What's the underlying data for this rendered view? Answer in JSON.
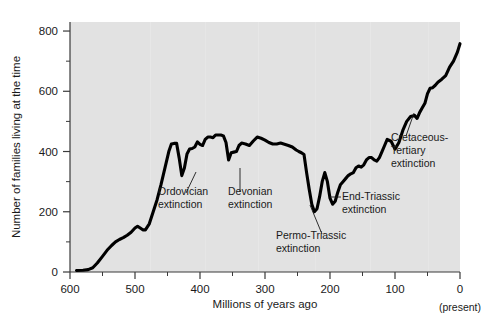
{
  "chart_data": {
    "type": "line",
    "title": "",
    "xlabel": "Millions of years ago",
    "ylabel": "Number of families living at the time",
    "xlim": [
      600,
      0
    ],
    "ylim": [
      0,
      830
    ],
    "x_ticks": [
      600,
      500,
      400,
      300,
      200,
      100,
      0
    ],
    "x_tick_labels": [
      "600",
      "500",
      "400",
      "300",
      "200",
      "100",
      "0"
    ],
    "x_minor_ticks": [
      550,
      450,
      350,
      250,
      150,
      50
    ],
    "y_ticks": [
      0,
      200,
      400,
      600,
      800
    ],
    "y_tick_labels": [
      "0",
      "200",
      "400",
      "600",
      "800"
    ],
    "y_minor_ticks": [
      100,
      300,
      500,
      700
    ],
    "grid": false,
    "legend": "none",
    "x_axis_direction": "reversed",
    "present_note": "(present)",
    "line_color": "#000000",
    "plot_background": "#e2e2e2",
    "series": [
      {
        "name": "Number of families",
        "x": [
          590,
          580,
          572,
          565,
          558,
          550,
          543,
          536,
          530,
          524,
          518,
          512,
          506,
          500,
          496,
          492,
          488,
          484,
          478,
          472,
          466,
          460,
          454,
          448,
          444,
          440,
          436,
          432,
          428,
          424,
          420,
          416,
          412,
          408,
          404,
          400,
          396,
          392,
          388,
          384,
          380,
          376,
          372,
          368,
          364,
          360,
          356,
          352,
          348,
          344,
          340,
          336,
          330,
          324,
          318,
          312,
          306,
          300,
          294,
          288,
          282,
          276,
          270,
          264,
          258,
          252,
          248,
          244,
          240,
          236,
          232,
          228,
          224,
          220,
          216,
          212,
          208,
          204,
          200,
          196,
          192,
          188,
          184,
          180,
          176,
          172,
          168,
          164,
          160,
          156,
          152,
          148,
          144,
          140,
          136,
          132,
          128,
          124,
          120,
          116,
          112,
          106,
          100,
          94,
          88,
          82,
          76,
          70,
          66,
          62,
          58,
          54,
          50,
          46,
          42,
          38,
          34,
          28,
          22,
          16,
          10,
          4,
          0
        ],
        "y": [
          5,
          6,
          8,
          14,
          30,
          52,
          72,
          88,
          100,
          108,
          114,
          122,
          132,
          146,
          152,
          146,
          140,
          140,
          160,
          200,
          240,
          290,
          345,
          400,
          425,
          427,
          427,
          378,
          320,
          345,
          392,
          408,
          410,
          415,
          432,
          424,
          420,
          440,
          448,
          448,
          446,
          455,
          455,
          455,
          452,
          430,
          372,
          396,
          398,
          400,
          420,
          428,
          425,
          420,
          435,
          448,
          444,
          438,
          430,
          425,
          425,
          428,
          424,
          420,
          415,
          405,
          400,
          396,
          390,
          330,
          275,
          225,
          200,
          210,
          250,
          300,
          330,
          300,
          245,
          225,
          235,
          265,
          290,
          300,
          310,
          320,
          326,
          330,
          346,
          352,
          348,
          356,
          372,
          380,
          380,
          372,
          368,
          380,
          400,
          420,
          440,
          434,
          408,
          430,
          470,
          500,
          516,
          520,
          510,
          530,
          545,
          560,
          592,
          610,
          612,
          620,
          630,
          640,
          652,
          680,
          700,
          730,
          758
        ]
      }
    ],
    "annotations": [
      {
        "id": "ordovician",
        "lines": [
          "Ordovician",
          "extinction"
        ],
        "text_x": 158,
        "text_y": 195,
        "leader": {
          "x1": 186,
          "y1": 193,
          "x2": 196,
          "y2": 172
        }
      },
      {
        "id": "devonian",
        "lines": [
          "Devonian",
          "extinction"
        ],
        "text_x": 228,
        "text_y": 195,
        "leader": {
          "x1": 240,
          "y1": 192,
          "x2": 240,
          "y2": 168
        }
      },
      {
        "id": "permo-triassic",
        "lines": [
          "Permo-Triassic",
          "extinction"
        ],
        "text_x": 276,
        "text_y": 239,
        "leader": {
          "x1": 322,
          "y1": 234,
          "x2": 310,
          "y2": 205
        }
      },
      {
        "id": "end-triassic",
        "lines": [
          "End-Triassic",
          "extinction"
        ],
        "text_x": 342,
        "text_y": 200,
        "leader": {
          "x1": 341,
          "y1": 197,
          "x2": 330,
          "y2": 197
        }
      },
      {
        "id": "cretaceous-tertiary",
        "lines": [
          "Cretaceous-",
          "Tertiary",
          "extinction"
        ],
        "text_x": 391,
        "text_y": 141,
        "leader": {
          "x1": 406,
          "y1": 136,
          "x2": 414,
          "y2": 113
        }
      }
    ]
  }
}
